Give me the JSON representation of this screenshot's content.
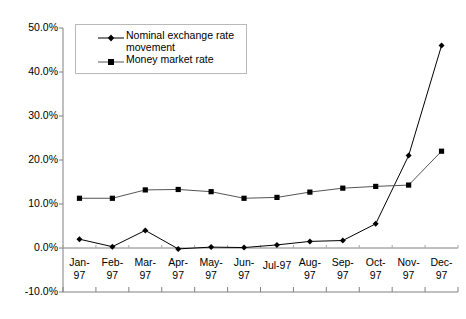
{
  "chart_data": {
    "type": "line",
    "title": "",
    "xlabel": "",
    "ylabel": "",
    "ylim": [
      -10,
      50
    ],
    "ytick_step": 10,
    "ytick_format": "percent-1dp",
    "grid": false,
    "legend_position": "top-left-inside",
    "categories": [
      "Jan-97",
      "Feb-97",
      "Mar-97",
      "Apr-97",
      "May-97",
      "Jun-97",
      "Jul-97",
      "Aug-97",
      "Sep-97",
      "Oct-97",
      "Nov-97",
      "Dec-97"
    ],
    "ytick_labels": [
      "50.0%",
      "40.0%",
      "30.0%",
      "20.0%",
      "10.0%",
      "0.0%",
      "-10.0%"
    ],
    "ytick_values": [
      50,
      40,
      30,
      20,
      10,
      0,
      -10
    ],
    "series": [
      {
        "name": "Nominal exchange rate movement",
        "marker": "diamond",
        "color": "#000000",
        "values": [
          2.0,
          0.3,
          4.0,
          -0.2,
          0.2,
          0.1,
          0.7,
          1.5,
          1.7,
          5.5,
          21.0,
          46.0
        ]
      },
      {
        "name": "Money market rate",
        "marker": "square",
        "color": "#555555",
        "values": [
          11.3,
          11.3,
          13.2,
          13.3,
          12.8,
          11.3,
          11.5,
          12.7,
          13.6,
          14.0,
          14.3,
          22.0
        ]
      }
    ]
  },
  "legend": {
    "entries": [
      {
        "label": "Nominal exchange rate\nmovement",
        "marker": "diamond"
      },
      {
        "label": "Money market rate",
        "marker": "square"
      }
    ]
  }
}
